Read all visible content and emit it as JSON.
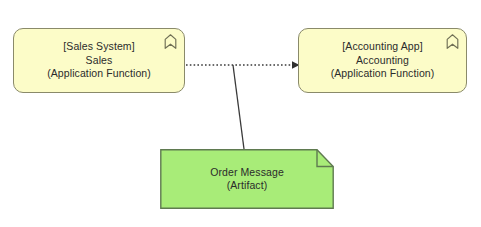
{
  "diagram": {
    "background_color": "#ffffff",
    "nodes": [
      {
        "id": "sales",
        "context": "[Sales System]",
        "name": "Sales",
        "stereotype": "(Application Function)",
        "type": "Application Function",
        "icon": "application-function-icon",
        "fill_color": "#fcfcc8",
        "border_color": "#8a8a6a",
        "text_color": "#2b2b2b"
      },
      {
        "id": "accounting",
        "context": "[Accounting App]",
        "name": "Accounting",
        "stereotype": "(Application Function)",
        "type": "Application Function",
        "icon": "application-function-icon",
        "fill_color": "#fcfcc8",
        "border_color": "#8a8a6a",
        "text_color": "#2b2b2b"
      },
      {
        "id": "order-message",
        "context": "",
        "name": "Order Message",
        "stereotype": "(Artifact)",
        "type": "Artifact",
        "icon": "artifact-folded-corner-icon",
        "fill_color": "#a8ec78",
        "border_color": "#5f7a50",
        "text_color": "#2b2b2b"
      }
    ],
    "connections": [
      {
        "id": "flow-sales-to-accounting",
        "from": "sales",
        "to": "accounting",
        "relationship": "Flow",
        "line_style": "dotted",
        "arrow_head": "filled-triangle",
        "color": "#3a3a3a"
      },
      {
        "id": "association-artifact-to-flow",
        "from": "order-message",
        "to": "flow-sales-to-accounting",
        "relationship": "Association",
        "line_style": "solid",
        "arrow_head": "none",
        "color": "#3a3a3a"
      }
    ]
  }
}
